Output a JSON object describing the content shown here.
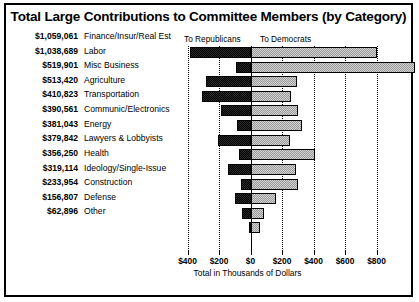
{
  "title": "Total Large Contributions to Committee Members (by Category)",
  "headers": {
    "republicans": "To Republicans",
    "democrats": "To Democrats"
  },
  "axis": {
    "xlabel": "Total in Thousands of Dollars",
    "ticks": [
      "$400",
      "$200",
      "$0",
      "$200",
      "$400",
      "$600",
      "$800"
    ]
  },
  "rows": [
    {
      "amount": "$1,059,061",
      "category": "Finance/Insur/Real Est"
    },
    {
      "amount": "$1,038,689",
      "category": "Labor"
    },
    {
      "amount": "$519,901",
      "category": "Misc Business"
    },
    {
      "amount": "$513,420",
      "category": "Agriculture"
    },
    {
      "amount": "$410,823",
      "category": "Transportation"
    },
    {
      "amount": "$390,561",
      "category": "Communic/Electronics"
    },
    {
      "amount": "$381,043",
      "category": "Energy"
    },
    {
      "amount": "$379,842",
      "category": "Lawyers & Lobbyists"
    },
    {
      "amount": "$356,250",
      "category": "Health"
    },
    {
      "amount": "$319,114",
      "category": "Ideology/Single-Issue"
    },
    {
      "amount": "$233,954",
      "category": "Construction"
    },
    {
      "amount": "$156,807",
      "category": "Defense"
    },
    {
      "amount": "$62,896",
      "category": "Other"
    }
  ],
  "chart_data": {
    "type": "bar",
    "orientation": "horizontal",
    "style": "diverging-bidirectional",
    "title": "Total Large Contributions to Committee Members (by Category)",
    "xlabel": "Total in Thousands of Dollars",
    "ylabel": "",
    "xlim": [
      -400,
      800
    ],
    "xticks": [
      -400,
      -200,
      0,
      200,
      400,
      600,
      800
    ],
    "xticklabels": [
      "$400",
      "$200",
      "$0",
      "$200",
      "$400",
      "$600",
      "$800"
    ],
    "grid": true,
    "legend_position": "top",
    "units": "thousands of dollars",
    "note": "Left of zero = contributions To Republicans; right of zero = To Democrats",
    "categories": [
      "Finance/Insur/Real Est",
      "Labor",
      "Misc Business",
      "Agriculture",
      "Transportation",
      "Communic/Electronics",
      "Energy",
      "Lawyers & Lobbyists",
      "Health",
      "Ideology/Single-Issue",
      "Construction",
      "Defense",
      "Other"
    ],
    "totals": [
      1059061,
      1038689,
      519901,
      513420,
      410823,
      390561,
      381043,
      379842,
      356250,
      319114,
      233954,
      156807,
      62896
    ],
    "series": [
      {
        "name": "To Republicans",
        "color": "#1a1a1a",
        "values": [
          -385,
          -90,
          -285,
          -310,
          -190,
          -85,
          -205,
          -75,
          -145,
          -60,
          -100,
          -55,
          -10
        ]
      },
      {
        "name": "To Democrats",
        "color": "#d2d2d2",
        "values": [
          795,
          1040,
          290,
          250,
          295,
          320,
          245,
          405,
          280,
          295,
          155,
          80,
          55
        ]
      }
    ]
  }
}
